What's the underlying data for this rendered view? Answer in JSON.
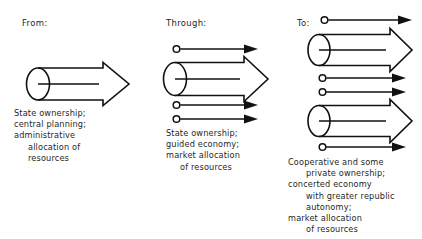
{
  "diagram": {
    "title_visible": false,
    "background_color": "#ffffff",
    "ink_color": "#111111",
    "columns": [
      {
        "id": "from",
        "heading": "From:",
        "caption_lines": [
          "State ownership;",
          "central planning;",
          "administrative",
          "allocation of",
          "resources"
        ],
        "arrows": [
          {
            "type": "block-arrow",
            "label": "state-sector-block-arrow"
          }
        ]
      },
      {
        "id": "through",
        "heading": "Through:",
        "caption_lines": [
          "State ownership;",
          "guided economy;",
          "market allocation",
          "of resources"
        ],
        "arrows": [
          {
            "type": "thin-arrow",
            "label": "small-sector-arrow"
          },
          {
            "type": "block-arrow",
            "label": "state-sector-block-arrow"
          },
          {
            "type": "thin-arrow",
            "label": "small-sector-arrow"
          },
          {
            "type": "thin-arrow",
            "label": "small-sector-arrow"
          }
        ]
      },
      {
        "id": "to",
        "heading": "To:",
        "caption_lines": [
          "Cooperative and some",
          "private ownership;",
          "concerted economy",
          "with greater republic",
          "autonomy;",
          "market allocation",
          "of resources"
        ],
        "arrows": [
          {
            "type": "thin-arrow",
            "label": "small-sector-arrow"
          },
          {
            "type": "block-arrow",
            "label": "state-sector-block-arrow"
          },
          {
            "type": "thin-arrow",
            "label": "small-sector-arrow"
          },
          {
            "type": "thin-arrow",
            "label": "small-sector-arrow"
          },
          {
            "type": "block-arrow",
            "label": "state-sector-block-arrow"
          },
          {
            "type": "thin-arrow",
            "label": "small-sector-arrow"
          }
        ]
      }
    ]
  }
}
